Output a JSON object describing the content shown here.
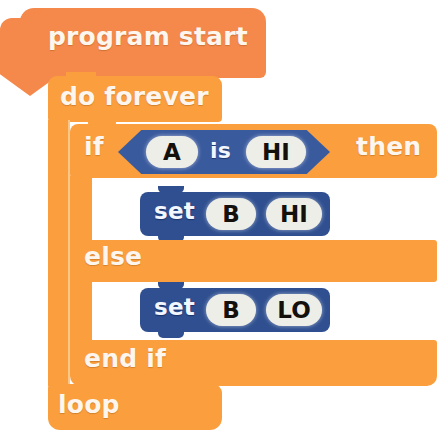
{
  "program": {
    "title": "program start",
    "blocks": {
      "start_label": "program start",
      "forever_label": "do forever",
      "loop_label": "loop",
      "if_label": "if",
      "then_label": "then",
      "else_label": "else",
      "endif_label": "end if",
      "set_label": "set"
    },
    "condition": {
      "operand_left": "A",
      "operator": "is",
      "operand_right": "HI"
    },
    "then_branch": {
      "action": "set",
      "target": "B",
      "value": "HI"
    },
    "else_branch": {
      "action": "set",
      "target": "B",
      "value": "LO"
    }
  },
  "colors": {
    "hat_orange": "#f5894c",
    "block_orange": "#fb9f3e",
    "condition_blue": "#3a5a9e",
    "statement_blue": "#2f4f90",
    "pill_cream": "#eeeee8",
    "text_cream": "#fdf6ee",
    "canvas": "#ffffff"
  }
}
